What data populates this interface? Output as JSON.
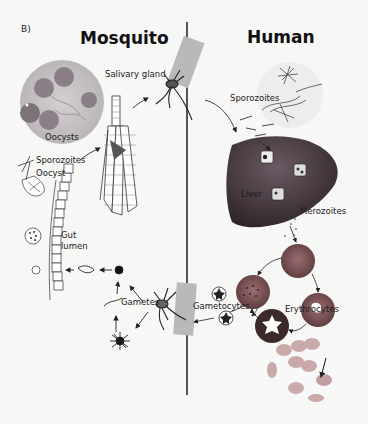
{
  "figure": {
    "panel_label": "B)",
    "columns": {
      "left_title": "Mosquito",
      "right_title": "Human"
    },
    "labels": {
      "salivary_gland": "Salivary gland",
      "oocysts": "Oocysts",
      "sporozoites_mosquito": "Sporozoites",
      "oocyst": "Oocyst",
      "gut_lumen_1": "Gut",
      "gut_lumen_2": "lumen",
      "gametes": "Gametes",
      "sporozoites_human": "Sporozoites",
      "liver": "Liver",
      "merozoites": "Merozoites",
      "gametocytes": "Gametocytes",
      "erythrocytes": "Erythrocytes"
    },
    "colors": {
      "background": "#f7f7f5",
      "divider": "#555555",
      "liver": "#4a3c45",
      "rbc": "#7a4f52",
      "skin_patch": "#b9b9b9",
      "micrograph_oocyst": "#a8a2a6"
    }
  }
}
